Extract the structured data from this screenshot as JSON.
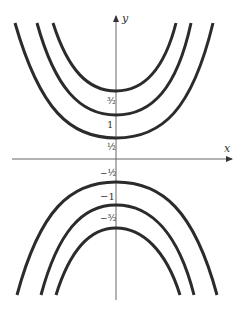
{
  "diagram": {
    "type": "level curves (hyperbolas) y^2 - x^2 = c",
    "axes": {
      "x_label": "x",
      "y_label": "y"
    },
    "colors": {
      "curve": "#2b2b2b",
      "axis": "#666666",
      "label": "#333333"
    },
    "upper_curves": [
      {
        "label": "1/2",
        "label_display": "½",
        "vertex_y_px": 138
      },
      {
        "label": "1",
        "label_display": "1",
        "vertex_y_px": 115
      },
      {
        "label": "3/2",
        "label_display": "³⁄₂",
        "vertex_y_px": 91
      }
    ],
    "lower_curves": [
      {
        "label": "-1/2",
        "label_display": "−½",
        "vertex_y_px": 182
      },
      {
        "label": "-1",
        "label_display": "−1",
        "vertex_y_px": 205
      },
      {
        "label": "-3/2",
        "label_display": "−³⁄₂",
        "vertex_y_px": 228
      }
    ]
  }
}
